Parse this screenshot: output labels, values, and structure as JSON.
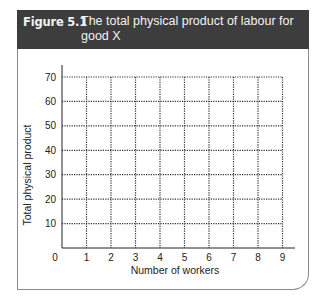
{
  "figure": {
    "label": "Figure 5.1",
    "title": "The total physical product of labour for good X",
    "header_bg": "#3d3d3d"
  },
  "chart_data": {
    "type": "line",
    "title": "The total physical product of labour for good X",
    "xlabel": "Number of workers",
    "ylabel": "Total physical product",
    "x_ticks": [
      0,
      1,
      2,
      3,
      4,
      5,
      6,
      7,
      8,
      9
    ],
    "y_ticks": [
      10,
      20,
      30,
      40,
      50,
      60,
      70
    ],
    "origin_label": "0",
    "xlim": [
      0,
      9
    ],
    "ylim": [
      0,
      70
    ],
    "grid": "dotted",
    "series": []
  }
}
